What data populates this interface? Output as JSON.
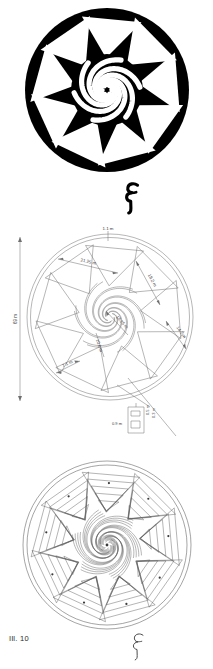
{
  "figure": {
    "caption": "Ill. 10",
    "panels": [
      {
        "id": "silhouette",
        "name": "black-and-white rosette silhouette"
      },
      {
        "id": "measured-plan",
        "name": "measured line plan with dimensions"
      },
      {
        "id": "contour-rendering",
        "name": "contour and stipple rendering"
      }
    ]
  },
  "glyphs": {
    "top": "spiral-scroll-mark",
    "bottom": "spiral-scroll-mark"
  },
  "plan": {
    "overall_height_label": "69 m",
    "dimensions": [
      {
        "key": "top_apex",
        "label": "1.1 m"
      },
      {
        "key": "upper_left",
        "label": "21.25 m"
      },
      {
        "key": "upper_right",
        "label": "18.2 m"
      },
      {
        "key": "right",
        "label": "14.1 m"
      },
      {
        "key": "core_outer",
        "label": "16.25 m"
      },
      {
        "key": "core_inner",
        "label": "10.6 m"
      },
      {
        "key": "lower_left",
        "label": "7.1 m"
      }
    ],
    "detail_box": {
      "name": "enlarged joint detail",
      "dimensions": [
        {
          "key": "detail_width",
          "label": "0.9 m"
        },
        {
          "key": "detail_height",
          "label": "0.5 m"
        },
        {
          "key": "detail_depth",
          "label": "0.3 m"
        }
      ]
    }
  },
  "geometry": {
    "silhouette": {
      "disc_fill": "#000000",
      "triangle_fill": "#ffffff",
      "blade_count": 9,
      "spiral_arms": 6
    },
    "plan_line_color": "#6f6f6f",
    "contour_line_color": "#5a5a5a"
  },
  "colors": {
    "background": "#ffffff",
    "ink": "#000000",
    "line": "#6f6f6f",
    "caption": "#2a2a2a"
  }
}
